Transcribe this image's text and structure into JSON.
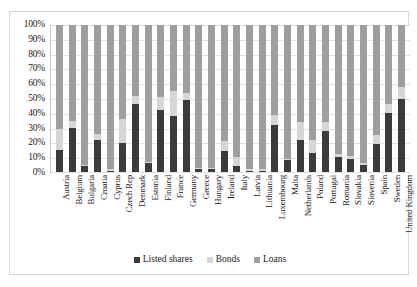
{
  "chart_data": {
    "type": "bar",
    "subtype": "stacked-100-percent-column",
    "title": "",
    "subtitle": "",
    "xlabel": "",
    "ylabel": "",
    "ylim": [
      0,
      100
    ],
    "y_tick_labels": [
      "100%",
      "90%",
      "80%",
      "70%",
      "60%",
      "50%",
      "40%",
      "30%",
      "20%",
      "10%",
      "0%"
    ],
    "y_tick_values": [
      100,
      90,
      80,
      70,
      60,
      50,
      40,
      30,
      20,
      10,
      0
    ],
    "grid": true,
    "legend_position": "bottom",
    "legend": [
      "Listed shares",
      "Bonds",
      "Loans"
    ],
    "series_colors": {
      "Listed shares": "#3b3b3b",
      "Bonds": "#d6d6d6",
      "Loans": "#9e9e9e"
    },
    "categories": [
      "Austria",
      "Belgium",
      "Bulgaria",
      "Croatia",
      "Cyprus",
      "Czech Rep",
      "Denmark",
      "Estonia",
      "Finland",
      "France",
      "Germany",
      "Greece",
      "Hungary",
      "Ireland",
      "Italy",
      "Latvia",
      "Lithuania",
      "Luxembourg",
      "Malta",
      "Netherlands",
      "Poland",
      "Portugal",
      "Romania",
      "Slovakia",
      "Slovenia",
      "Spain",
      "Sweden",
      "United Kingdom"
    ],
    "series": [
      {
        "name": "Listed shares",
        "values": [
          15,
          30,
          4,
          22,
          1,
          20,
          46,
          6,
          42,
          38,
          49,
          2,
          2,
          14,
          4,
          1,
          1,
          32,
          8,
          22,
          13,
          28,
          10,
          9,
          5,
          19,
          40,
          50
        ]
      },
      {
        "name": "Bonds",
        "values": [
          14,
          5,
          1,
          4,
          1,
          16,
          6,
          1,
          9,
          17,
          5,
          1,
          1,
          7,
          6,
          1,
          1,
          7,
          1,
          12,
          9,
          6,
          2,
          2,
          1,
          6,
          6,
          8
        ]
      },
      {
        "name": "Loans",
        "values": [
          71,
          65,
          95,
          74,
          98,
          64,
          48,
          93,
          49,
          45,
          46,
          97,
          97,
          79,
          90,
          98,
          98,
          61,
          91,
          66,
          78,
          66,
          88,
          89,
          94,
          75,
          54,
          42
        ]
      }
    ]
  }
}
